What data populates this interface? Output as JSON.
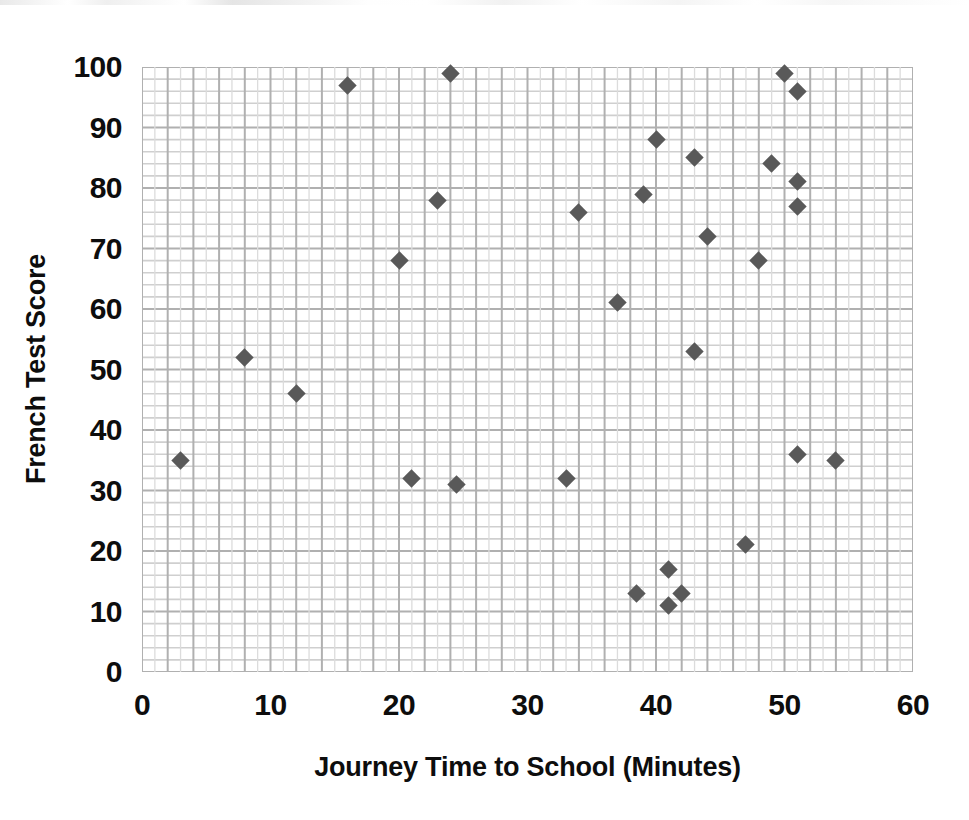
{
  "chart_data": {
    "type": "scatter",
    "title": "",
    "xlabel": "Journey Time to School (Minutes)",
    "ylabel": "French Test Score",
    "xlim": [
      0,
      60
    ],
    "ylim": [
      0,
      100
    ],
    "xticks": [
      0,
      10,
      20,
      30,
      40,
      50,
      60
    ],
    "yticks": [
      0,
      10,
      20,
      30,
      40,
      50,
      60,
      70,
      80,
      90,
      100
    ],
    "x_minor_step": 2,
    "y_minor_step": 2,
    "grid": true,
    "legend": false,
    "marker": "diamond",
    "marker_color": "#595959",
    "grid_color": "#bfbfbf",
    "text_color": "#0d0d0d",
    "series": [
      {
        "name": "French Test Score vs Journey Time",
        "points": [
          {
            "x": 3,
            "y": 35
          },
          {
            "x": 8,
            "y": 52
          },
          {
            "x": 12,
            "y": 46
          },
          {
            "x": 16,
            "y": 97
          },
          {
            "x": 20,
            "y": 68
          },
          {
            "x": 21,
            "y": 32
          },
          {
            "x": 23,
            "y": 78
          },
          {
            "x": 24,
            "y": 99
          },
          {
            "x": 24.5,
            "y": 31
          },
          {
            "x": 33,
            "y": 32
          },
          {
            "x": 34,
            "y": 76
          },
          {
            "x": 37,
            "y": 61
          },
          {
            "x": 38.5,
            "y": 13
          },
          {
            "x": 39,
            "y": 79
          },
          {
            "x": 40,
            "y": 88
          },
          {
            "x": 41,
            "y": 17
          },
          {
            "x": 41,
            "y": 11
          },
          {
            "x": 42,
            "y": 13
          },
          {
            "x": 43,
            "y": 53
          },
          {
            "x": 43,
            "y": 85
          },
          {
            "x": 44,
            "y": 72
          },
          {
            "x": 47,
            "y": 21
          },
          {
            "x": 48,
            "y": 68
          },
          {
            "x": 49,
            "y": 84
          },
          {
            "x": 50,
            "y": 99
          },
          {
            "x": 51,
            "y": 96
          },
          {
            "x": 51,
            "y": 81
          },
          {
            "x": 51,
            "y": 77
          },
          {
            "x": 51,
            "y": 36
          },
          {
            "x": 54,
            "y": 35
          }
        ]
      }
    ]
  }
}
